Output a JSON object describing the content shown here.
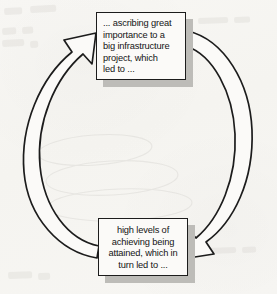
{
  "diagram": {
    "type": "cycle",
    "background_color": "#f6f5f2",
    "line_color": "#1c1c1c",
    "box_fill": "#fbfaf8",
    "shadow_color": "#bdbcb8",
    "nodes": [
      {
        "id": "node-top",
        "position": "top",
        "text_lines": [
          "... ascribing great",
          "importance to a",
          "big infrastructure",
          "project, which",
          "led to ..."
        ],
        "text": "... ascribing great importance to a big infrastructure project, which led to ...",
        "align": "left"
      },
      {
        "id": "node-bottom",
        "position": "bottom",
        "text_lines": [
          "high levels of",
          "achieving being",
          "attained, which in",
          "turn led to ..."
        ],
        "text": "high levels of achieving being attained, which in turn led to ...",
        "align": "center"
      }
    ],
    "connectors": [
      {
        "id": "arrow-left",
        "from": "node-bottom",
        "to": "node-top",
        "side": "left",
        "direction": "counter-clockwise-upward",
        "style": "curved-outlined-band-with-arrowhead"
      },
      {
        "id": "arrow-right",
        "from": "node-top",
        "to": "node-bottom",
        "side": "right",
        "direction": "clockwise-downward",
        "style": "curved-outlined-band-with-arrowhead"
      }
    ]
  }
}
